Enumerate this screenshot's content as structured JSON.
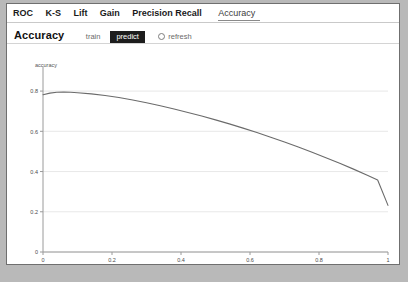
{
  "window": {
    "background_color": "#b9b9b9",
    "panel_color": "#ffffff"
  },
  "tabs": [
    {
      "label": "ROC",
      "active": false
    },
    {
      "label": "K-S",
      "active": false
    },
    {
      "label": "Lift",
      "active": false
    },
    {
      "label": "Gain",
      "active": false
    },
    {
      "label": "Precision Recall",
      "active": false
    },
    {
      "label": "Accuracy",
      "active": true
    }
  ],
  "toolbar": {
    "title": "Accuracy",
    "dataset_options": [
      "train",
      "predict"
    ],
    "train_label": "train",
    "predict_label": "predict",
    "selected_dataset": "predict",
    "refresh_label": "refresh",
    "refresh_checked": false
  },
  "chart_data": {
    "type": "line",
    "title": "",
    "xlabel": "",
    "ylabel": "accuracy",
    "xlim": [
      0,
      1
    ],
    "ylim": [
      0,
      0.88
    ],
    "grid": true,
    "legend": false,
    "line_color": "#6b6b6b",
    "xticks": [
      "0",
      "0.2",
      "0.4",
      "0.6",
      "0.8",
      "1"
    ],
    "xtick_values": [
      0,
      0.2,
      0.4,
      0.6,
      0.8,
      1
    ],
    "yticks": [
      "0",
      "0.2",
      "0.4",
      "0.6",
      "0.8"
    ],
    "ytick_values": [
      0,
      0.2,
      0.4,
      0.6,
      0.8
    ],
    "series": [
      {
        "name": "accuracy",
        "x": [
          0.0,
          0.02,
          0.04,
          0.06,
          0.08,
          0.1,
          0.14,
          0.18,
          0.22,
          0.26,
          0.3,
          0.34,
          0.38,
          0.42,
          0.46,
          0.5,
          0.54,
          0.58,
          0.62,
          0.66,
          0.7,
          0.74,
          0.78,
          0.82,
          0.86,
          0.9,
          0.94,
          0.97,
          1.0
        ],
        "y": [
          0.782,
          0.79,
          0.794,
          0.795,
          0.794,
          0.792,
          0.786,
          0.778,
          0.768,
          0.756,
          0.742,
          0.727,
          0.711,
          0.694,
          0.676,
          0.657,
          0.637,
          0.616,
          0.594,
          0.571,
          0.547,
          0.522,
          0.496,
          0.469,
          0.441,
          0.412,
          0.382,
          0.358,
          0.232
        ]
      }
    ]
  }
}
